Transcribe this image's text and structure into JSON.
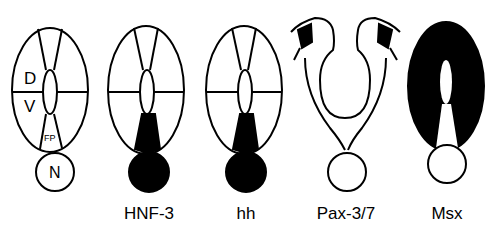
{
  "figure": {
    "panels": [
      {
        "id": "reference",
        "label": "",
        "region_labels": {
          "dorsal": "D",
          "ventral": "V",
          "floor_plate": "FP",
          "notochord": "N"
        }
      },
      {
        "id": "hnf3",
        "label": "HNF-3",
        "expression": "floor plate and notochord"
      },
      {
        "id": "hh",
        "label": "hh",
        "expression": "floor plate and notochord"
      },
      {
        "id": "pax37",
        "label": "Pax-3/7",
        "expression": "dorsal neural folds"
      },
      {
        "id": "msx",
        "label": "Msx",
        "expression": "entire neural tube except floor plate"
      }
    ],
    "colors": {
      "stroke": "#000000",
      "fill_expressed": "#000000",
      "background": "#ffffff"
    }
  }
}
